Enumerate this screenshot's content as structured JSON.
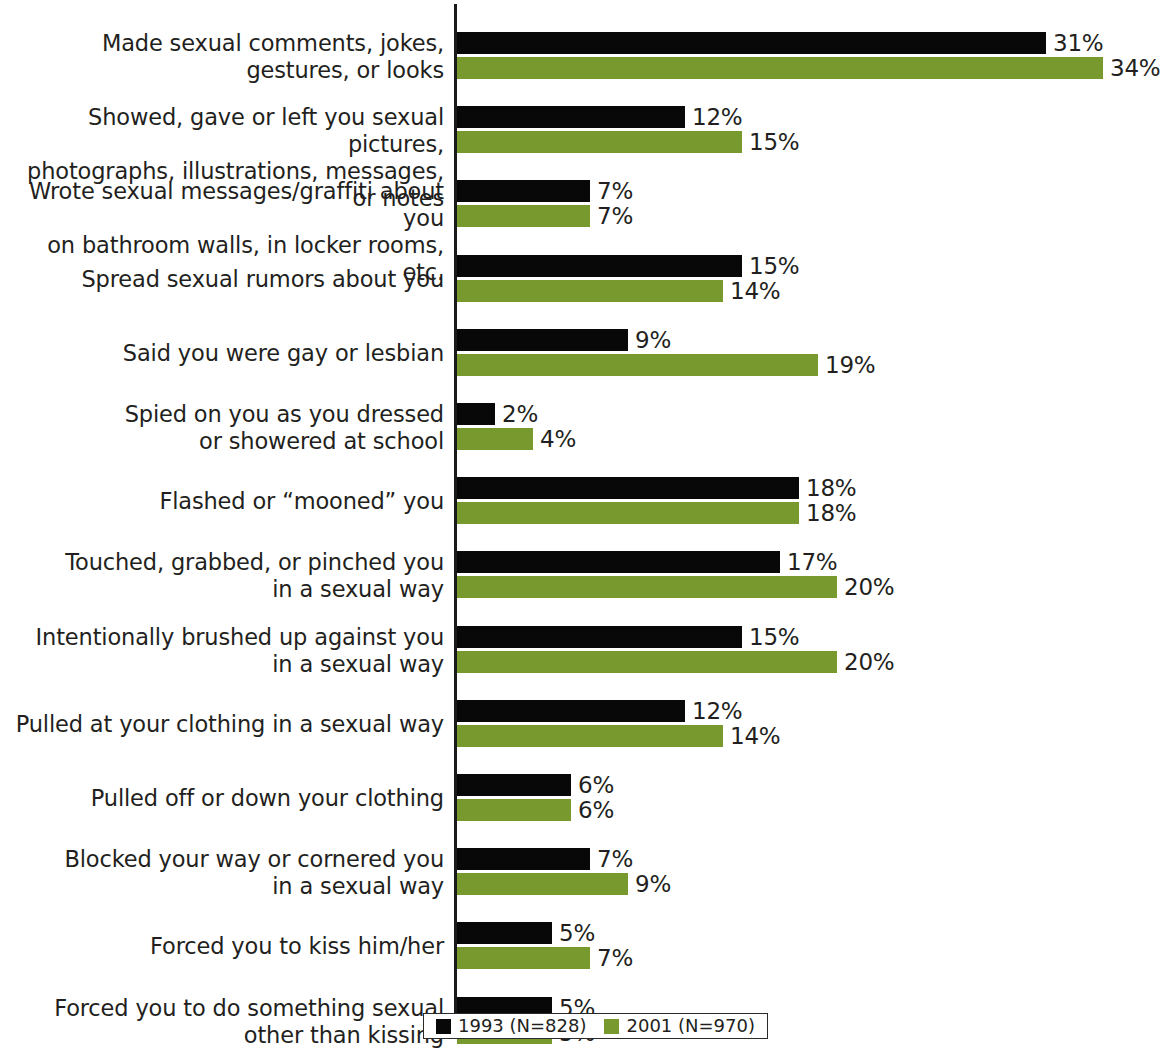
{
  "chart_data": {
    "type": "bar",
    "orientation": "horizontal",
    "title": "",
    "subtitle": "",
    "xlabel": "",
    "ylabel": "",
    "xlim": [
      0,
      35
    ],
    "grid": false,
    "legend_position": "bottom",
    "value_suffix": "%",
    "categories": [
      "Made sexual comments, jokes,\ngestures, or looks",
      "Showed, gave or left you sexual pictures,\nphotographs, illustrations, messages, or notes",
      "Wrote sexual messages/graffiti about you\non bathroom walls, in locker rooms, etc.",
      "Spread sexual rumors about you",
      "Said you were gay or lesbian",
      "Spied on you as you dressed\nor showered at school",
      "Flashed or “mooned” you",
      "Touched, grabbed, or pinched you\nin a sexual way",
      "Intentionally brushed up against you\nin a sexual way",
      "Pulled at your clothing in a sexual way",
      "Pulled off or down your clothing",
      "Blocked your way or cornered you\nin a sexual way",
      "Forced you to kiss him/her",
      "Forced you to do something sexual\nother than kissing"
    ],
    "series": [
      {
        "name": "1993 (N=828)",
        "color": "#080808",
        "values": [
          31,
          12,
          7,
          15,
          9,
          2,
          18,
          17,
          15,
          12,
          6,
          7,
          5,
          5
        ],
        "labels": [
          "31%",
          "12%",
          "7%",
          "15%",
          "9%",
          "2%",
          "18%",
          "17%",
          "15%",
          "12%",
          "6%",
          "7%",
          "5%",
          "5%"
        ]
      },
      {
        "name": "2001 (N=970)",
        "color": "#77992e",
        "values": [
          34,
          15,
          7,
          14,
          19,
          4,
          18,
          20,
          20,
          14,
          6,
          9,
          7,
          5
        ],
        "labels": [
          "34%",
          "15%",
          "7%",
          "14%",
          "19%",
          "4%",
          "18%",
          "18%",
          "20%",
          "20%",
          "14%",
          "6%",
          "9%",
          "7%",
          "5%"
        ]
      }
    ]
  },
  "legend": {
    "items": [
      {
        "label": "1993 (N=828)",
        "color": "#080808",
        "swatch": "square-black"
      },
      {
        "label": "2001 (N=970)",
        "color": "#77992e",
        "swatch": "square-green"
      }
    ]
  }
}
